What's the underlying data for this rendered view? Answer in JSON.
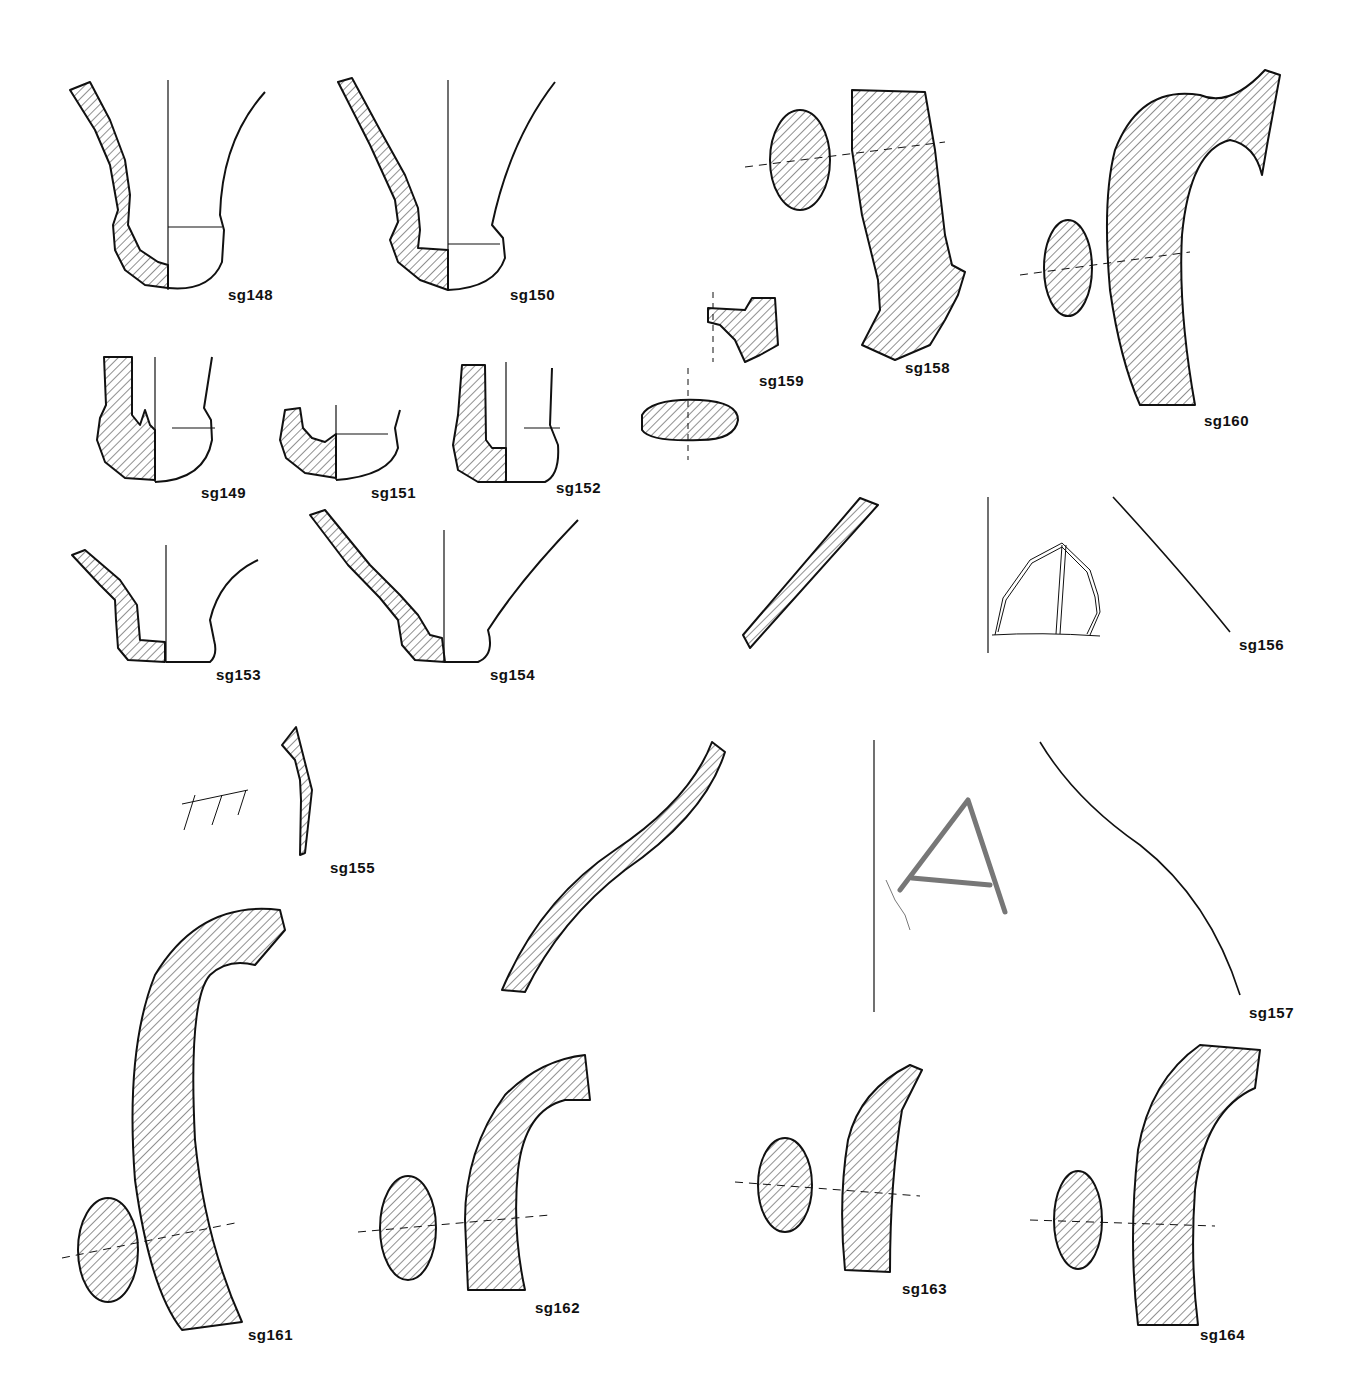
{
  "plate": {
    "background": "#ffffff",
    "ink_color": "#111111",
    "hatch_pattern": "diagonal-45deg"
  },
  "figures": [
    {
      "id": "sg148",
      "label": "sg148",
      "type": "vessel-base-profile",
      "label_pos": [
        228,
        298
      ]
    },
    {
      "id": "sg150",
      "label": "sg150",
      "type": "vessel-base-profile",
      "label_pos": [
        510,
        298
      ]
    },
    {
      "id": "sg149",
      "label": "sg149",
      "type": "vessel-base-profile",
      "label_pos": [
        201,
        496
      ]
    },
    {
      "id": "sg151",
      "label": "sg151",
      "type": "vessel-base-profile",
      "label_pos": [
        371,
        496
      ]
    },
    {
      "id": "sg152",
      "label": "sg152",
      "type": "vessel-base-profile",
      "label_pos": [
        556,
        491
      ]
    },
    {
      "id": "sg153",
      "label": "sg153",
      "type": "vessel-base-profile",
      "label_pos": [
        216,
        678
      ]
    },
    {
      "id": "sg154",
      "label": "sg154",
      "type": "vessel-base-profile",
      "label_pos": [
        490,
        678
      ]
    },
    {
      "id": "sg155",
      "label": "sg155",
      "type": "wall-sherd-with-graffito",
      "label_pos": [
        330,
        871
      ]
    },
    {
      "id": "sg156",
      "label": "sg156",
      "type": "wall-sherd-with-incised-sign",
      "label_pos": [
        1239,
        648
      ]
    },
    {
      "id": "sg157",
      "label": "sg157",
      "type": "wall-sherd-with-letter-A",
      "label_pos": [
        1249,
        1016
      ]
    },
    {
      "id": "sg158",
      "label": "sg158",
      "type": "handle-with-section",
      "label_pos": [
        905,
        371
      ]
    },
    {
      "id": "sg159",
      "label": "sg159",
      "type": "handle-fragment-with-section",
      "label_pos": [
        759,
        384
      ]
    },
    {
      "id": "sg160",
      "label": "sg160",
      "type": "handle-with-section",
      "label_pos": [
        1204,
        424
      ]
    },
    {
      "id": "sg161",
      "label": "sg161",
      "type": "handle-with-section",
      "label_pos": [
        248,
        1338
      ]
    },
    {
      "id": "sg162",
      "label": "sg162",
      "type": "handle-with-section",
      "label_pos": [
        535,
        1311
      ]
    },
    {
      "id": "sg163",
      "label": "sg163",
      "type": "handle-with-section",
      "label_pos": [
        902,
        1292
      ]
    },
    {
      "id": "sg164",
      "label": "sg164",
      "type": "handle-with-section",
      "label_pos": [
        1200,
        1338
      ]
    }
  ],
  "inscriptions": [
    {
      "figure": "sg155",
      "description": "scratched graffito of three strokes",
      "glyph": "ꟷ|||"
    },
    {
      "figure": "sg157",
      "description": "incised letter",
      "glyph": "A"
    }
  ]
}
